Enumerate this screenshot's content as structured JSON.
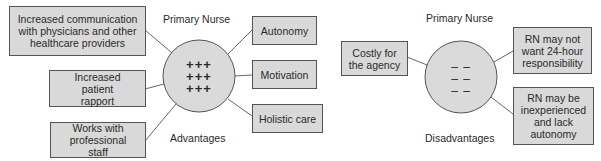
{
  "advantages": {
    "title": "Primary Nurse",
    "caption": "Advantages",
    "circle_symbols": [
      "+++",
      "+++",
      "+++"
    ],
    "items": [
      "Increased communication with physicians and other healthcare providers",
      "Increased patient rapport",
      "Works with professional staff",
      "Autonomy",
      "Motivation",
      "Holistic care"
    ]
  },
  "disadvantages": {
    "title": "Primary Nurse",
    "caption": "Disadvantages",
    "circle_symbols": [
      "– –",
      "– –",
      "– –"
    ],
    "items": [
      "Costly for the agency",
      "RN may not want 24-hour responsibility",
      "RN may be inexperienced and lack autonomy"
    ]
  },
  "colors": {
    "box_fill": "#d9d9d9",
    "circle_fill": "#dadada",
    "stroke": "#555555"
  }
}
